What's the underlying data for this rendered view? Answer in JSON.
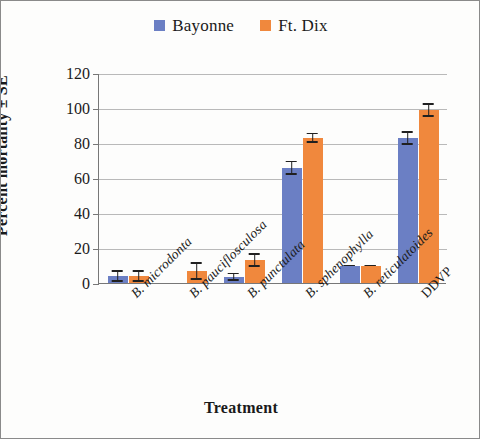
{
  "chart_data": {
    "type": "bar",
    "title": "",
    "xlabel": "Treatment",
    "ylabel": "Percent mortality ± SE",
    "ylim": [
      0,
      120
    ],
    "yticks": [
      0,
      20,
      40,
      60,
      80,
      100,
      120
    ],
    "grid": true,
    "legend_position": "top-center",
    "categories": [
      "B. microdonta",
      "B. pauciflosculosa",
      "B. punctulata",
      "B. sphenophylla",
      "B. reticulatoides",
      "DDVP"
    ],
    "category_styles": [
      "italic",
      "italic",
      "italic",
      "italic",
      "italic",
      "upright"
    ],
    "series": [
      {
        "name": "Bayonne",
        "color": "#6b7fc4",
        "values": [
          4,
          0,
          3.5,
          66,
          10,
          83
        ],
        "errors": [
          3.5,
          0,
          2.5,
          4,
          0.5,
          4
        ]
      },
      {
        "name": "Ft. Dix",
        "color": "#f0883d",
        "values": [
          4,
          7,
          13,
          83,
          10,
          99
        ],
        "errors": [
          3.5,
          5,
          4,
          3,
          0.5,
          4
        ]
      }
    ]
  },
  "legend": {
    "items": [
      {
        "label": "Bayonne",
        "color": "#6b7fc4"
      },
      {
        "label": "Ft. Dix",
        "color": "#f0883d"
      }
    ]
  },
  "axes": {
    "y_title": "Percent mortality ± SE",
    "x_title": "Treatment",
    "y_tick_labels": [
      "120",
      "100",
      "80",
      "60",
      "40",
      "20",
      "0"
    ]
  }
}
